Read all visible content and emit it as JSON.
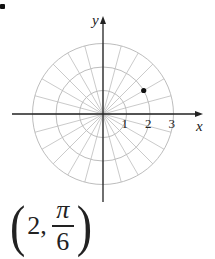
{
  "figure": {
    "type": "polar-coordinate-plot",
    "origin_px": [
      103,
      114
    ],
    "unit_px": 23.5,
    "rings": [
      1,
      2,
      3
    ],
    "spoke_angle_step_deg": 15,
    "grid_color": "#bdbdbd",
    "axis_color": "#222222",
    "axes": {
      "x_label": "x",
      "y_label": "y",
      "x_ticks": [
        "1",
        "2",
        "3"
      ]
    },
    "point": {
      "r": 2,
      "theta_label": "π/6",
      "theta_rad": 0.5235987756,
      "color": "#111111"
    }
  },
  "caption": {
    "open": "(",
    "r_value": "2,",
    "theta_numerator": "π",
    "theta_denominator": "6",
    "close": ")"
  }
}
